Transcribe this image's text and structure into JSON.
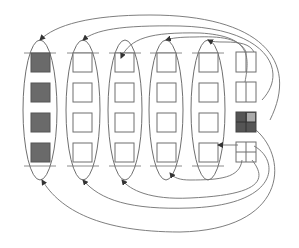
{
  "diagram": {
    "title": "",
    "colors": {
      "stroke": "#6f6f6f",
      "filled": "#6a6a6a",
      "empty": "#ffffff",
      "background": "#ffffff"
    },
    "groups": [
      {
        "id": "group-1",
        "cx": 40,
        "filled": true,
        "cells": 4
      },
      {
        "id": "group-2",
        "cx": 83,
        "filled": false,
        "cells": 4
      },
      {
        "id": "group-3",
        "cx": 125,
        "filled": false,
        "cells": 4
      },
      {
        "id": "group-4",
        "cx": 166,
        "filled": false,
        "cells": 4
      },
      {
        "id": "group-5",
        "cx": 208,
        "filled": false,
        "cells": 4
      }
    ],
    "pointer_boxes": [
      {
        "id": "pointer-1",
        "y": 50,
        "filled": false
      },
      {
        "id": "pointer-2",
        "y": 80,
        "filled": false
      },
      {
        "id": "pointer-3",
        "y": 113,
        "filled": true
      },
      {
        "id": "pointer-4",
        "y": 143,
        "filled": false
      }
    ],
    "labels": []
  }
}
